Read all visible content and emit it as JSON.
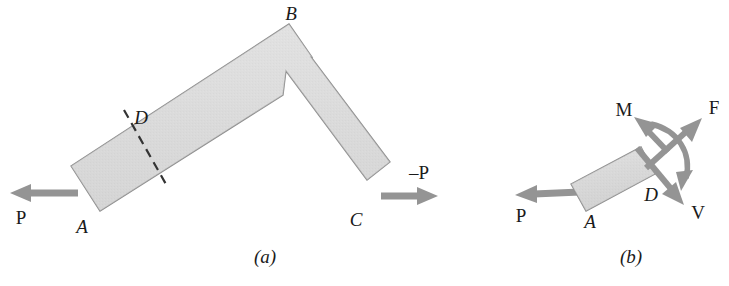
{
  "figure": {
    "background_color": "#ffffff",
    "body_fill_color": "#dcdcdc",
    "body_edge_color": "#8c8c8c",
    "arrow_color": "#949494",
    "label_color": "#1a1a1a",
    "dash_color": "#333333"
  },
  "panel_a": {
    "caption": "(a)",
    "point_labels": {
      "A": "A",
      "B": "B",
      "C": "C",
      "D": "D"
    },
    "force_labels": {
      "P_left": "P",
      "P_right": "–P"
    },
    "geometry": {
      "segment_AB_angle_deg": -33,
      "segment_BC_angle_deg": 68,
      "bar_width_px": 28,
      "cut_location": "D",
      "cut_style": "dashed"
    }
  },
  "panel_b": {
    "caption": "(b)",
    "point_labels": {
      "A": "A",
      "D": "D"
    },
    "force_labels": {
      "P": "P",
      "M": "M",
      "F": "F",
      "V": "V"
    },
    "geometry": {
      "block_angle_deg": -28,
      "block_width_px": 80,
      "block_height_px": 34,
      "moment_arc": "curved-double-arrow"
    }
  }
}
